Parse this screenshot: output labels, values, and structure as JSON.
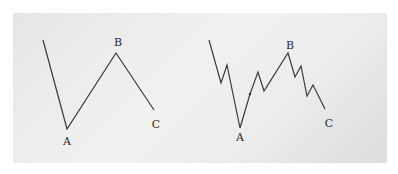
{
  "diagrams": [
    {
      "name": "simple-abc",
      "points": [
        [
          43,
          40
        ],
        [
          67,
          129
        ],
        [
          116,
          53
        ],
        [
          154,
          110
        ]
      ],
      "labels": [
        {
          "text": "A",
          "x": 67,
          "y": 145
        },
        {
          "text": "B",
          "x": 118,
          "y": 46
        },
        {
          "text": "C",
          "x": 156,
          "y": 128
        }
      ]
    },
    {
      "name": "detailed-abc",
      "points": [
        [
          209,
          40
        ],
        [
          221,
          83
        ],
        [
          227,
          65
        ],
        [
          240,
          128
        ],
        [
          250,
          94
        ],
        [
          258,
          72
        ],
        [
          264,
          91
        ],
        [
          288,
          53
        ],
        [
          295,
          77
        ],
        [
          301,
          66
        ],
        [
          307,
          96
        ],
        [
          313,
          85
        ],
        [
          325,
          109
        ]
      ],
      "labels": [
        {
          "text": "A",
          "x": 240,
          "y": 141
        },
        {
          "text": "B",
          "x": 290,
          "y": 49
        },
        {
          "text": "C",
          "x": 329,
          "y": 127
        }
      ]
    }
  ],
  "colors": {
    "line": "#3a3a3a",
    "text": "#2a2a2a"
  }
}
